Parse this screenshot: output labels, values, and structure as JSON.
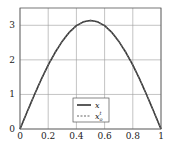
{
  "chart_data": {
    "type": "line",
    "title": "",
    "xlabel": "",
    "ylabel": "",
    "xlim": [
      0,
      1
    ],
    "ylim": [
      0,
      3.5
    ],
    "grid": true,
    "x_ticks": [
      "0",
      "0.2",
      "0.4",
      "0.6",
      "0.8",
      "1"
    ],
    "y_ticks": [
      "0",
      "1",
      "2",
      "3"
    ],
    "legend_position": "lower center",
    "x": [
      0,
      0.05,
      0.1,
      0.15,
      0.2,
      0.25,
      0.3,
      0.35,
      0.4,
      0.45,
      0.5,
      0.55,
      0.6,
      0.65,
      0.7,
      0.75,
      0.8,
      0.85,
      0.9,
      0.95,
      1
    ],
    "series": [
      {
        "name": "x",
        "style": "solid",
        "color": "#333333",
        "values": [
          0,
          0.49,
          0.97,
          1.43,
          1.85,
          2.22,
          2.54,
          2.8,
          2.99,
          3.1,
          3.14,
          3.1,
          2.99,
          2.8,
          2.54,
          2.22,
          1.85,
          1.43,
          0.97,
          0.49,
          0
        ]
      },
      {
        "name": "x_o^t",
        "style": "dashed",
        "color": "#666666",
        "values": [
          0,
          0.49,
          0.97,
          1.43,
          1.85,
          2.22,
          2.54,
          2.8,
          2.99,
          3.1,
          3.14,
          3.1,
          2.99,
          2.8,
          2.54,
          2.22,
          1.85,
          1.43,
          0.97,
          0.49,
          0
        ]
      }
    ]
  },
  "legend": {
    "items": [
      {
        "label": "x",
        "sup": "",
        "sub": ""
      },
      {
        "label": "x",
        "sup": "t",
        "sub": "o"
      }
    ]
  }
}
